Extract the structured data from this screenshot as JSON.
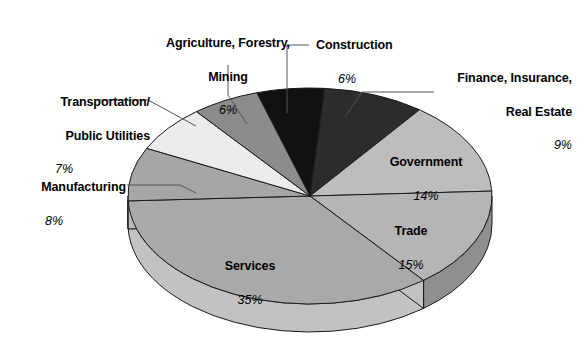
{
  "chart_data": {
    "type": "pie",
    "title": "",
    "subtitle": "",
    "xlabel": "",
    "ylabel": "",
    "legend_position": "none",
    "grid": false,
    "three_d": true,
    "units": "percent",
    "total": 100,
    "categories": [
      "Construction",
      "Finance, Insurance, Real Estate",
      "Government",
      "Trade",
      "Services",
      "Manufacturing",
      "Transportation/ Public Utilities",
      "Agriculture, Forestry, Mining"
    ],
    "values": [
      6,
      9,
      14,
      15,
      35,
      8,
      7,
      6
    ],
    "slices": [
      {
        "name": "Construction",
        "label_line1": "Construction",
        "label_line2": "",
        "value": 6,
        "percent_text": "6%",
        "color": "#111111",
        "side_color": "#0d0d0d",
        "label_placement": "external-leader"
      },
      {
        "name": "Finance, Insurance, Real Estate",
        "label_line1": "Finance, Insurance,",
        "label_line2": "Real Estate",
        "value": 9,
        "percent_text": "9%",
        "color": "#2c2c2c",
        "side_color": "#232323",
        "label_placement": "external-leader"
      },
      {
        "name": "Government",
        "label_line1": "Government",
        "label_line2": "",
        "value": 14,
        "percent_text": "14%",
        "color": "#bdbdbd",
        "side_color": "#9a9a9a",
        "label_placement": "on-slice"
      },
      {
        "name": "Trade",
        "label_line1": "Trade",
        "label_line2": "",
        "value": 15,
        "percent_text": "15%",
        "color": "#b5b5b5",
        "side_color": "#8f8f8f",
        "label_placement": "on-slice"
      },
      {
        "name": "Services",
        "label_line1": "Services",
        "label_line2": "",
        "value": 35,
        "percent_text": "35%",
        "color": "#a9a9a9",
        "side_color": "#c2c2c2",
        "label_placement": "on-slice"
      },
      {
        "name": "Manufacturing",
        "label_line1": "Manufacturing",
        "label_line2": "",
        "value": 8,
        "percent_text": "8%",
        "color": "#a6a6a6",
        "side_color": "#bcbcbc",
        "label_placement": "external-leader"
      },
      {
        "name": "Transportation/Public Utilities",
        "label_line1": "Transportation/",
        "label_line2": "Public Utilities",
        "value": 7,
        "percent_text": "7%",
        "color": "#ececec",
        "side_color": "#d2d2d2",
        "label_placement": "external-leader"
      },
      {
        "name": "Agriculture, Forestry, Mining",
        "label_line1": "Agriculture, Forestry,",
        "label_line2": "Mining",
        "value": 6,
        "percent_text": "6%",
        "color": "#8c8c8c",
        "side_color": "#787878",
        "label_placement": "external-leader"
      }
    ]
  },
  "labels": {
    "agriculture": {
      "line1": "Agriculture, Forestry,",
      "line2": "Mining",
      "pct": "6%"
    },
    "construction": {
      "line1": "Construction",
      "line2": "",
      "pct": "6%"
    },
    "finance": {
      "line1": "Finance, Insurance,",
      "line2": "Real Estate",
      "pct": "9%"
    },
    "transportation": {
      "line1": "Transportation/",
      "line2": "Public Utilities",
      "pct": "7%"
    },
    "manufacturing": {
      "line1": "Manufacturing",
      "line2": "",
      "pct": "8%"
    },
    "government": {
      "line1": "Government",
      "line2": "",
      "pct": "14%"
    },
    "trade": {
      "line1": "Trade",
      "line2": "",
      "pct": "15%"
    },
    "services": {
      "line1": "Services",
      "line2": "",
      "pct": "35%"
    }
  },
  "style": {
    "outline_color": "#1a1a1a",
    "leader_color": "#555555",
    "background": "#ffffff"
  }
}
